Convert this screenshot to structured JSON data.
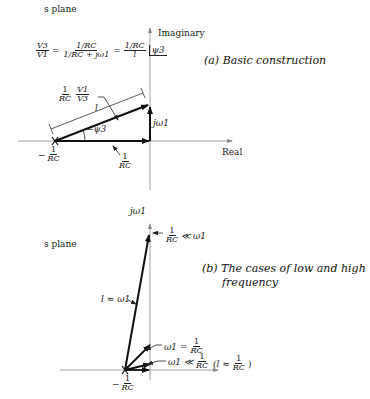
{
  "panel_a": {
    "plane_label": "s plane",
    "axis_imag": "Imaginary",
    "axis_real": "Real",
    "caption": "(a)  Basic construction",
    "equation": {
      "lhs_num": "V3",
      "lhs_den": "V1",
      "eq": "=",
      "mid_num": "1/RC",
      "mid_den": "1/RC + jω1",
      "rhs": "= 1/RC / l ∠ψ3",
      "rhs_num": "1/RC",
      "rhs_den": "l",
      "angle": "ψ3"
    },
    "vector_label_1_num": "1",
    "vector_label_1_den": "RC",
    "vector_label_2_num": "V1",
    "vector_label_2_den": "V3",
    "length_label": "l",
    "angle_label": "−ψ3",
    "jw_label": "jω1",
    "pole_label_prefix": "−",
    "pole_label_num": "1",
    "pole_label_den": "RC",
    "real_seg_num": "1",
    "real_seg_den": "RC"
  },
  "panel_b": {
    "plane_label": "s plane",
    "jw_axis_label": "jω1",
    "caption_line1": "(b)  The cases of low and high",
    "caption_line2": "frequency",
    "high_freq_label": "1/RC ≪ ω1",
    "high_num": "1",
    "high_den": "RC",
    "high_rel": "≪ ω1",
    "approx_label": "l ≈ ω1",
    "eq_label_prefix": "ω1 =",
    "eq_num": "1",
    "eq_den": "RC",
    "low_label_prefix": "ω1 ≪",
    "low_num": "1",
    "low_den": "RC",
    "low_approx_prefix": "(l ≈",
    "low_approx_num": "1",
    "low_approx_den": "RC",
    "low_approx_suffix": ")",
    "pole_prefix": "−",
    "pole_num": "1",
    "pole_den": "RC"
  },
  "colors": {
    "ink": "#111111",
    "axis": "#999999",
    "background": "#ffffff"
  }
}
